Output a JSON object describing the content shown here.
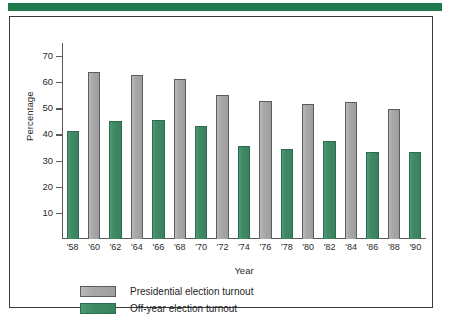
{
  "banner": {
    "color": "#1d7a4d"
  },
  "chart_data": {
    "type": "bar",
    "title": "",
    "xlabel": "Year",
    "ylabel": "Percentage",
    "ylim": [
      0,
      75
    ],
    "yticks": [
      10,
      20,
      30,
      40,
      50,
      60,
      70
    ],
    "ytick_labels": [
      "10",
      "20",
      "30",
      "40",
      "50",
      "60",
      "70"
    ],
    "grid": false,
    "legend_position": "bottom-left",
    "categories": [
      "'58",
      "'60",
      "'62",
      "'64",
      "'66",
      "'68",
      "'70",
      "'72",
      "'74",
      "'76",
      "'78",
      "'80",
      "'82",
      "'84",
      "'86",
      "'88",
      "'90"
    ],
    "bars": [
      {
        "category": "'58",
        "series": "Off-year election turnout",
        "value": 41.4
      },
      {
        "category": "'60",
        "series": "Presidential election turnout",
        "value": 63.8
      },
      {
        "category": "'62",
        "series": "Off-year election turnout",
        "value": 45.1
      },
      {
        "category": "'64",
        "series": "Presidential election turnout",
        "value": 62.8
      },
      {
        "category": "'66",
        "series": "Off-year election turnout",
        "value": 45.7
      },
      {
        "category": "'68",
        "series": "Presidential election turnout",
        "value": 61.4
      },
      {
        "category": "'70",
        "series": "Off-year election turnout",
        "value": 43.2
      },
      {
        "category": "'72",
        "series": "Presidential election turnout",
        "value": 55.1
      },
      {
        "category": "'74",
        "series": "Off-year election turnout",
        "value": 35.7
      },
      {
        "category": "'76",
        "series": "Presidential election turnout",
        "value": 52.7
      },
      {
        "category": "'78",
        "series": "Off-year election turnout",
        "value": 34.5
      },
      {
        "category": "'80",
        "series": "Presidential election turnout",
        "value": 51.8
      },
      {
        "category": "'82",
        "series": "Off-year election turnout",
        "value": 37.6
      },
      {
        "category": "'84",
        "series": "Presidential election turnout",
        "value": 52.5
      },
      {
        "category": "'86",
        "series": "Off-year election turnout",
        "value": 33.4
      },
      {
        "category": "'88",
        "series": "Presidential election turnout",
        "value": 49.7
      },
      {
        "category": "'90",
        "series": "Off-year election turnout",
        "value": 33.2
      }
    ],
    "series": [
      {
        "name": "Presidential election turnout",
        "color": "#a8a8a8",
        "x": [
          "'60",
          "'64",
          "'68",
          "'72",
          "'76",
          "'80",
          "'84",
          "'88"
        ],
        "values": [
          63.8,
          62.8,
          61.4,
          55.1,
          52.7,
          51.8,
          52.5,
          49.7
        ]
      },
      {
        "name": "Off-year election turnout",
        "color": "#3f8a64",
        "x": [
          "'58",
          "'62",
          "'66",
          "'70",
          "'74",
          "'78",
          "'82",
          "'86",
          "'90"
        ],
        "values": [
          41.4,
          45.1,
          45.7,
          43.2,
          35.7,
          34.5,
          37.6,
          33.4,
          33.2
        ]
      }
    ]
  },
  "legend": {
    "items": [
      {
        "label": "Presidential election turnout",
        "color": "#a8a8a8",
        "key": "presidential"
      },
      {
        "label": "Off-year election turnout",
        "color": "#3f8a64",
        "key": "offyear"
      }
    ]
  }
}
